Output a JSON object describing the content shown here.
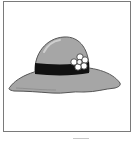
{
  "image": {
    "subject": "sun hat",
    "alt": "Gray wide-brimmed hat with black band and white flower"
  },
  "colors": {
    "frame": "#7a7a7a",
    "hat": "#a6a6a6",
    "hat_highlight": "#c4c4c4",
    "hat_outline": "#555555",
    "band": "#111111",
    "flower": "#ffffff",
    "flower_center": "#f2f2f2"
  }
}
